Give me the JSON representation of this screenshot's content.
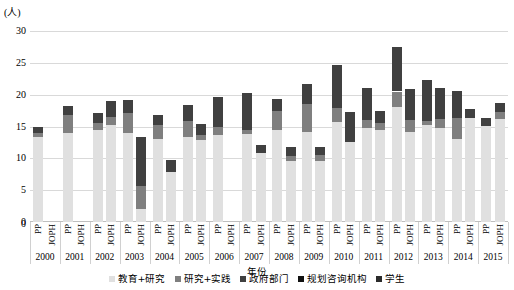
{
  "chart_data": {
    "type": "bar",
    "subtype": "stacked-grouped",
    "title": "",
    "xlabel": "年份",
    "ylabel": "(人)",
    "ylim": [
      0,
      30
    ],
    "yticks": [
      0,
      5,
      10,
      15,
      20,
      25,
      30
    ],
    "grid": true,
    "legend_position": "bottom",
    "categories": [
      "2000",
      "2001",
      "2002",
      "2003",
      "2004",
      "2005",
      "2006",
      "2007",
      "2008",
      "2009",
      "2010",
      "2011",
      "2012",
      "2013",
      "2014",
      "2015"
    ],
    "group_labels": [
      "PP",
      "JOPH"
    ],
    "series": [
      {
        "name": "教育+研究",
        "color": "#e0e0e0"
      },
      {
        "name": "研究+实践",
        "color": "#7f7f7f"
      },
      {
        "name": "政府部门",
        "color": "#404040"
      },
      {
        "name": "规划咨询机构",
        "color": "#111111"
      },
      {
        "name": "学生",
        "color": "#2b2b2b"
      }
    ],
    "bars": [
      {
        "year": "2000",
        "journal": "PP",
        "total": 15.0,
        "values": [
          13.3,
          0.7,
          1.0,
          0.0,
          0.0
        ]
      },
      {
        "year": "2000",
        "journal": "JOPH",
        "total": 0.0,
        "values": [
          0.0,
          0.0,
          0.0,
          0.0,
          0.0
        ]
      },
      {
        "year": "2001",
        "journal": "PP",
        "total": 18.2,
        "values": [
          14.0,
          2.8,
          1.4,
          0.0,
          0.0
        ]
      },
      {
        "year": "2001",
        "journal": "JOPH",
        "total": 0.0,
        "values": [
          0.0,
          0.0,
          0.0,
          0.0,
          0.0
        ]
      },
      {
        "year": "2002",
        "journal": "PP",
        "total": 17.2,
        "values": [
          14.5,
          1.0,
          1.7,
          0.0,
          0.0
        ]
      },
      {
        "year": "2002",
        "journal": "JOPH",
        "total": 19.0,
        "values": [
          15.3,
          1.2,
          2.5,
          0.0,
          0.0
        ]
      },
      {
        "year": "2003",
        "journal": "PP",
        "total": 19.2,
        "values": [
          14.0,
          3.2,
          2.0,
          0.0,
          0.0
        ]
      },
      {
        "year": "2003",
        "journal": "JOPH",
        "total": 13.4,
        "values": [
          2.1,
          3.6,
          7.7,
          0.0,
          0.0
        ]
      },
      {
        "year": "2004",
        "journal": "PP",
        "total": 16.8,
        "values": [
          13.0,
          2.3,
          1.5,
          0.0,
          0.0
        ]
      },
      {
        "year": "2004",
        "journal": "JOPH",
        "total": 9.8,
        "values": [
          7.9,
          0.0,
          1.9,
          0.0,
          0.0
        ]
      },
      {
        "year": "2005",
        "journal": "PP",
        "total": 18.4,
        "values": [
          13.3,
          2.6,
          2.5,
          0.0,
          0.0
        ]
      },
      {
        "year": "2005",
        "journal": "JOPH",
        "total": 15.4,
        "values": [
          12.9,
          0.8,
          1.7,
          0.0,
          0.0
        ]
      },
      {
        "year": "2006",
        "journal": "PP",
        "total": 19.6,
        "values": [
          13.6,
          1.4,
          4.6,
          0.0,
          0.0
        ]
      },
      {
        "year": "2006",
        "journal": "JOPH",
        "total": 0.0,
        "values": [
          0.0,
          0.0,
          0.0,
          0.0,
          0.0
        ]
      },
      {
        "year": "2007",
        "journal": "PP",
        "total": 20.3,
        "values": [
          13.8,
          0.6,
          5.9,
          0.0,
          0.0
        ]
      },
      {
        "year": "2007",
        "journal": "JOPH",
        "total": 12.1,
        "values": [
          10.8,
          0.0,
          1.3,
          0.0,
          0.0
        ]
      },
      {
        "year": "2008",
        "journal": "PP",
        "total": 19.3,
        "values": [
          14.4,
          3.1,
          1.8,
          0.0,
          0.0
        ]
      },
      {
        "year": "2008",
        "journal": "JOPH",
        "total": 11.8,
        "values": [
          9.6,
          0.8,
          1.4,
          0.0,
          0.0
        ]
      },
      {
        "year": "2009",
        "journal": "PP",
        "total": 21.6,
        "values": [
          14.1,
          4.4,
          3.1,
          0.0,
          0.0
        ]
      },
      {
        "year": "2009",
        "journal": "JOPH",
        "total": 11.8,
        "values": [
          9.6,
          0.9,
          1.3,
          0.0,
          0.0
        ]
      },
      {
        "year": "2010",
        "journal": "PP",
        "total": 24.6,
        "values": [
          15.7,
          2.2,
          6.7,
          0.0,
          0.0
        ]
      },
      {
        "year": "2010",
        "journal": "JOPH",
        "total": 17.3,
        "values": [
          12.5,
          0.0,
          4.8,
          0.0,
          0.0
        ]
      },
      {
        "year": "2011",
        "journal": "PP",
        "total": 21.0,
        "values": [
          14.8,
          1.3,
          4.9,
          0.0,
          0.0
        ]
      },
      {
        "year": "2011",
        "journal": "JOPH",
        "total": 17.4,
        "values": [
          14.5,
          1.0,
          1.9,
          0.0,
          0.0
        ]
      },
      {
        "year": "2012",
        "journal": "PP",
        "total": 27.5,
        "values": [
          18.0,
          2.5,
          7.0,
          0.0,
          0.0
        ]
      },
      {
        "year": "2012",
        "journal": "JOPH",
        "total": 20.9,
        "values": [
          14.1,
          2.0,
          4.8,
          0.0,
          0.0
        ]
      },
      {
        "year": "2013",
        "journal": "PP",
        "total": 22.3,
        "values": [
          15.3,
          0.6,
          6.4,
          0.0,
          0.0
        ]
      },
      {
        "year": "2013",
        "journal": "JOPH",
        "total": 21.0,
        "values": [
          14.8,
          1.4,
          4.8,
          0.0,
          0.0
        ]
      },
      {
        "year": "2014",
        "journal": "PP",
        "total": 20.6,
        "values": [
          13.1,
          3.2,
          4.3,
          0.0,
          0.0
        ]
      },
      {
        "year": "2014",
        "journal": "JOPH",
        "total": 17.7,
        "values": [
          16.3,
          0.0,
          1.4,
          0.0,
          0.0
        ]
      },
      {
        "year": "2015",
        "journal": "PP",
        "total": 16.4,
        "values": [
          15.1,
          0.0,
          1.3,
          0.0,
          0.0
        ]
      },
      {
        "year": "2015",
        "journal": "JOPH",
        "total": 18.7,
        "values": [
          16.2,
          1.1,
          1.4,
          0.0,
          0.0
        ]
      }
    ]
  }
}
